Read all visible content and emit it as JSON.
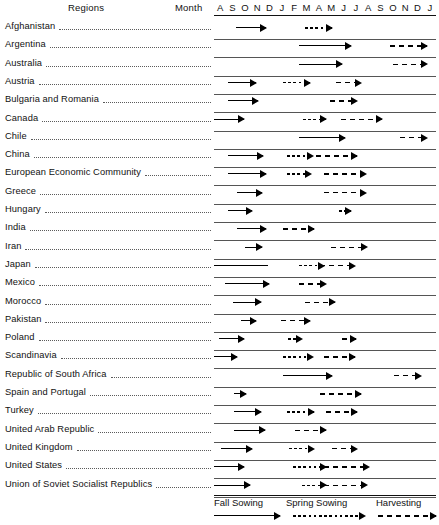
{
  "header": {
    "regions_label": "Regions",
    "month_label": "Month",
    "months": [
      "A",
      "S",
      "O",
      "N",
      "D",
      "J",
      "F",
      "M",
      "A",
      "M",
      "J",
      "J",
      "A",
      "S",
      "O",
      "N",
      "D",
      "J"
    ]
  },
  "legend": {
    "items": [
      {
        "label": "Fall Sowing",
        "style": "solid"
      },
      {
        "label": "Spring Sowing",
        "style": "dash"
      },
      {
        "label": "Harvesting",
        "style": "dashdash"
      }
    ]
  },
  "chart_data": {
    "type": "bar",
    "xlabel": "Month",
    "ylabel": "Regions",
    "categories": [
      "A",
      "S",
      "O",
      "N",
      "D",
      "J",
      "F",
      "M",
      "A",
      "M",
      "J",
      "J",
      "A",
      "S",
      "O",
      "N",
      "D",
      "J"
    ],
    "series": [
      {
        "name": "Fall Sowing",
        "style": "solid"
      },
      {
        "name": "Spring Sowing",
        "style": "dash"
      },
      {
        "name": "Harvesting",
        "style": "dashdash"
      }
    ],
    "rows": [
      {
        "region": "Afghanistan",
        "bars": [
          {
            "series": "Fall Sowing",
            "start": 1.8,
            "end": 4.2
          },
          {
            "series": "Spring Sowing",
            "start": 7.4,
            "end": 9.6
          }
        ]
      },
      {
        "region": "Argentina",
        "bars": [
          {
            "series": "Fall Sowing",
            "start": 6.9,
            "end": 11.1
          },
          {
            "series": "Harvesting",
            "start": 14.3,
            "end": 17.3
          }
        ]
      },
      {
        "region": "Australia",
        "bars": [
          {
            "series": "Fall Sowing",
            "start": 6.9,
            "end": 10.4
          },
          {
            "series": "Harvesting",
            "start": 14.5,
            "end": 17.3
          }
        ]
      },
      {
        "region": "Austria",
        "bars": [
          {
            "series": "Fall Sowing",
            "start": 1.1,
            "end": 3.4
          },
          {
            "series": "Spring Sowing",
            "start": 5.6,
            "end": 7.8
          },
          {
            "series": "Harvesting",
            "start": 9.9,
            "end": 11.9
          }
        ]
      },
      {
        "region": "Bulgaria and Romania",
        "bars": [
          {
            "series": "Fall Sowing",
            "start": 1.1,
            "end": 3.6
          },
          {
            "series": "Harvesting",
            "start": 9.4,
            "end": 11.6
          }
        ]
      },
      {
        "region": "Canada",
        "bars": [
          {
            "series": "Fall Sowing",
            "start": 0.0,
            "end": 2.4
          },
          {
            "series": "Spring Sowing",
            "start": 7.2,
            "end": 9.1
          },
          {
            "series": "Harvesting",
            "start": 10.3,
            "end": 13.6
          }
        ]
      },
      {
        "region": "Chile",
        "bars": [
          {
            "series": "Fall Sowing",
            "start": 6.9,
            "end": 10.6
          },
          {
            "series": "Harvesting",
            "start": 15.1,
            "end": 17.3
          }
        ]
      },
      {
        "region": "China",
        "bars": [
          {
            "series": "Fall Sowing",
            "start": 1.1,
            "end": 4.0
          },
          {
            "series": "Spring Sowing",
            "start": 5.9,
            "end": 8.0
          },
          {
            "series": "Harvesting",
            "start": 8.3,
            "end": 11.6
          }
        ]
      },
      {
        "region": "European Economic Community",
        "bars": [
          {
            "series": "Fall Sowing",
            "start": 1.1,
            "end": 4.2
          },
          {
            "series": "Spring Sowing",
            "start": 5.9,
            "end": 7.9
          },
          {
            "series": "Harvesting",
            "start": 8.9,
            "end": 12.3
          }
        ]
      },
      {
        "region": "Greece",
        "bars": [
          {
            "series": "Fall Sowing",
            "start": 1.9,
            "end": 3.9
          },
          {
            "series": "Harvesting",
            "start": 8.9,
            "end": 12.3
          }
        ]
      },
      {
        "region": "Hungary",
        "bars": [
          {
            "series": "Fall Sowing",
            "start": 1.1,
            "end": 3.1
          },
          {
            "series": "Spring Sowing",
            "start": 10.1,
            "end": 11.1
          }
        ]
      },
      {
        "region": "India",
        "bars": [
          {
            "series": "Fall Sowing",
            "start": 1.9,
            "end": 4.2
          },
          {
            "series": "Harvesting",
            "start": 5.6,
            "end": 8.1
          }
        ]
      },
      {
        "region": "Iran",
        "bars": [
          {
            "series": "Fall Sowing",
            "start": 2.5,
            "end": 3.9
          },
          {
            "series": "Harvesting",
            "start": 9.5,
            "end": 12.4
          }
        ]
      },
      {
        "region": "Japan",
        "bars": [
          {
            "series": "Fall Sowing",
            "start": 0.0,
            "end": 4.4,
            "nohead": true
          },
          {
            "series": "Spring Sowing",
            "start": 6.9,
            "end": 8.9
          },
          {
            "series": "Harvesting",
            "start": 8.6,
            "end": 11.4
          }
        ]
      },
      {
        "region": "Mexico",
        "bars": [
          {
            "series": "Fall Sowing",
            "start": 0.9,
            "end": 4.5
          },
          {
            "series": "Harvesting",
            "start": 6.9,
            "end": 9.1
          }
        ]
      },
      {
        "region": "Morocco",
        "bars": [
          {
            "series": "Fall Sowing",
            "start": 1.5,
            "end": 3.8
          },
          {
            "series": "Harvesting",
            "start": 7.4,
            "end": 9.8
          }
        ]
      },
      {
        "region": "Pakistan",
        "bars": [
          {
            "series": "Fall Sowing",
            "start": 2.2,
            "end": 3.4
          },
          {
            "series": "Harvesting",
            "start": 5.4,
            "end": 7.8
          }
        ]
      },
      {
        "region": "Poland",
        "bars": [
          {
            "series": "Fall Sowing",
            "start": 0.4,
            "end": 2.4
          },
          {
            "series": "Spring Sowing",
            "start": 6.0,
            "end": 7.1
          },
          {
            "series": "Harvesting",
            "start": 10.4,
            "end": 11.5
          }
        ]
      },
      {
        "region": "Scandinavia",
        "bars": [
          {
            "series": "Fall Sowing",
            "start": 0.0,
            "end": 1.9
          },
          {
            "series": "Spring Sowing",
            "start": 5.6,
            "end": 8.0
          },
          {
            "series": "Harvesting",
            "start": 8.9,
            "end": 11.4
          }
        ]
      },
      {
        "region": "Republic of South Africa",
        "bars": [
          {
            "series": "Fall Sowing",
            "start": 5.6,
            "end": 9.6
          },
          {
            "series": "Harvesting",
            "start": 14.6,
            "end": 16.8
          }
        ]
      },
      {
        "region": "Spain and Portugal",
        "bars": [
          {
            "series": "Fall Sowing",
            "start": 1.6,
            "end": 2.6
          },
          {
            "series": "Harvesting",
            "start": 8.6,
            "end": 11.9
          }
        ]
      },
      {
        "region": "Turkey",
        "bars": [
          {
            "series": "Fall Sowing",
            "start": 1.6,
            "end": 3.8
          },
          {
            "series": "Spring Sowing",
            "start": 5.9,
            "end": 8.1
          },
          {
            "series": "Harvesting",
            "start": 9.1,
            "end": 11.6
          }
        ]
      },
      {
        "region": "United Arab Republic",
        "bars": [
          {
            "series": "Fall Sowing",
            "start": 1.6,
            "end": 4.1
          },
          {
            "series": "Harvesting",
            "start": 6.6,
            "end": 9.1
          }
        ]
      },
      {
        "region": "United Kingdom",
        "bars": [
          {
            "series": "Fall Sowing",
            "start": 0.6,
            "end": 3.1
          },
          {
            "series": "Spring Sowing",
            "start": 6.1,
            "end": 8.1
          },
          {
            "series": "Harvesting",
            "start": 9.6,
            "end": 11.6
          }
        ]
      },
      {
        "region": "United States",
        "bars": [
          {
            "series": "Fall Sowing",
            "start": 0.0,
            "end": 2.4
          },
          {
            "series": "Spring Sowing",
            "start": 6.4,
            "end": 9.1
          },
          {
            "series": "Harvesting",
            "start": 8.9,
            "end": 12.6
          }
        ]
      },
      {
        "region": "Union of Soviet Socialist Republics",
        "bars": [
          {
            "series": "Fall Sowing",
            "start": 0.0,
            "end": 2.9
          },
          {
            "series": "Spring Sowing",
            "start": 7.1,
            "end": 9.1
          },
          {
            "series": "Harvesting",
            "start": 8.9,
            "end": 12.4
          }
        ]
      }
    ]
  }
}
